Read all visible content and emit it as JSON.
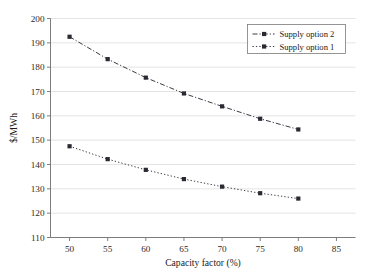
{
  "chart_data": {
    "type": "line",
    "title": "",
    "xlabel": "Capacity factor (%)",
    "ylabel": "$/MWh",
    "xlim": [
      47.5,
      87.5
    ],
    "ylim": [
      110,
      200
    ],
    "xticks": [
      50,
      55,
      60,
      65,
      70,
      75,
      80,
      85
    ],
    "yticks": [
      110,
      120,
      130,
      140,
      150,
      160,
      170,
      180,
      190,
      200
    ],
    "xtick_labels": [
      "50",
      "55",
      "60",
      "65",
      "70",
      "75",
      "80",
      "85"
    ],
    "ytick_labels": [
      "110",
      "120",
      "130",
      "140",
      "150",
      "160",
      "170",
      "180",
      "190",
      "200"
    ],
    "grid": "horizontal",
    "legend_position": "top-right",
    "x": [
      50,
      55,
      60,
      65,
      70,
      75,
      80
    ],
    "series": [
      {
        "name": "Supply option 2",
        "values": [
          192.5,
          183.3,
          175.7,
          169.2,
          163.9,
          158.8,
          154.4
        ],
        "marker": "square",
        "linestyle": "dash-dot",
        "color": "#3a3a46"
      },
      {
        "name": "Supply option 1",
        "values": [
          147.5,
          142.2,
          137.8,
          134.0,
          130.9,
          128.2,
          126.0
        ],
        "marker": "square",
        "linestyle": "dotted",
        "color": "#3a3a46"
      }
    ]
  },
  "legend": {
    "entries": [
      {
        "label": "Supply option 2"
      },
      {
        "label": "Supply option 1"
      }
    ]
  },
  "axes": {
    "x_title": "Capacity factor (%)",
    "y_title": "$/MWh"
  }
}
